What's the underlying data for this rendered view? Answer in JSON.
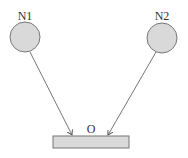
{
  "diagram": {
    "nodes": [
      {
        "id": "N1",
        "label": "N1",
        "shape": "circle",
        "cx": 25,
        "cy": 37,
        "r": 15,
        "fill": "#d9d9d9"
      },
      {
        "id": "N2",
        "label": "N2",
        "shape": "circle",
        "cx": 162,
        "cy": 38,
        "r": 15,
        "fill": "#d9d9d9"
      },
      {
        "id": "O",
        "label": "O",
        "shape": "rect",
        "x": 53,
        "y": 136,
        "width": 76,
        "height": 12,
        "fill": "#d9d9d9"
      }
    ],
    "edges": [
      {
        "from": "N1",
        "to": "O",
        "arrow": true
      },
      {
        "from": "N2",
        "to": "O",
        "arrow": true
      }
    ],
    "stroke_color": "#777777"
  }
}
